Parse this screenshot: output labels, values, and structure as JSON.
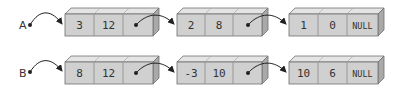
{
  "colors": {
    "face": "#d0d0d0",
    "top": "#e4e4e4",
    "side": "#a9a9a9",
    "stroke": "#6e6e6e",
    "arrow": "#222222"
  },
  "lists": [
    {
      "label": "A",
      "nodes": [
        [
          "3",
          "12",
          ""
        ],
        [
          "2",
          "8",
          ""
        ],
        [
          "1",
          "0",
          "NULL"
        ]
      ]
    },
    {
      "label": "B",
      "nodes": [
        [
          "8",
          "12",
          ""
        ],
        [
          "-3",
          "10",
          ""
        ],
        [
          "10",
          "6",
          "NULL"
        ]
      ]
    }
  ]
}
